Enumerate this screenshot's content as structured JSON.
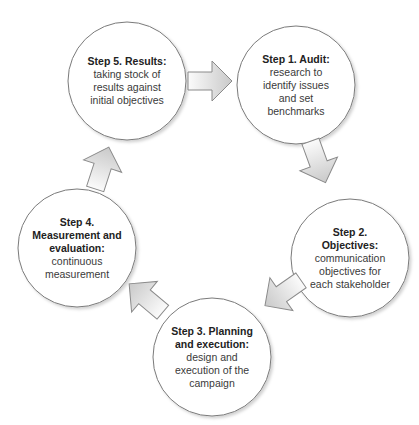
{
  "diagram": {
    "type": "cycle",
    "colors": {
      "circle_fill": "#ffffff",
      "circle_stroke": "#777777",
      "arrow_fill_light": "#fafafa",
      "arrow_fill_dark": "#c8c8c8",
      "arrow_stroke": "#888888",
      "text": "#333333"
    },
    "steps": [
      {
        "id": "step1",
        "title": "Step 1. Audit:",
        "title_lines": [
          "Step 1. Audit:"
        ],
        "description": "research to identify issues and set benchmarks",
        "desc_lines": [
          "research to",
          "identify issues",
          "and set",
          "benchmarks"
        ]
      },
      {
        "id": "step2",
        "title": "Step 2. Objectives:",
        "title_lines": [
          "Step 2.",
          "Objectives:"
        ],
        "description": "communication objectives for each stakeholder",
        "desc_lines": [
          "communication",
          "objectives for",
          "each stakeholder"
        ]
      },
      {
        "id": "step3",
        "title": "Step 3. Planning and execution:",
        "title_lines": [
          "Step 3. Planning",
          "and execution:"
        ],
        "description": "design and execution of the campaign",
        "desc_lines": [
          "design and",
          "execution of the",
          "campaign"
        ]
      },
      {
        "id": "step4",
        "title": "Step 4. Measurement and evaluation:",
        "title_lines": [
          "Step 4.",
          "Measurement and",
          "evaluation:"
        ],
        "description": "continuous measurement",
        "desc_lines": [
          "continuous",
          "measurement"
        ]
      },
      {
        "id": "step5",
        "title": "Step 5. Results:",
        "title_lines": [
          "Step 5. Results:"
        ],
        "description": "taking stock of results against initial objectives",
        "desc_lines": [
          "taking stock of",
          "results against",
          "initial objectives"
        ]
      }
    ],
    "arrows": [
      {
        "from": "step5",
        "to": "step1",
        "icon": "arrow-right-icon"
      },
      {
        "from": "step1",
        "to": "step2",
        "icon": "arrow-down-right-icon"
      },
      {
        "from": "step2",
        "to": "step3",
        "icon": "arrow-down-left-icon"
      },
      {
        "from": "step3",
        "to": "step4",
        "icon": "arrow-up-left-icon"
      },
      {
        "from": "step4",
        "to": "step5",
        "icon": "arrow-up-right-icon"
      }
    ]
  }
}
